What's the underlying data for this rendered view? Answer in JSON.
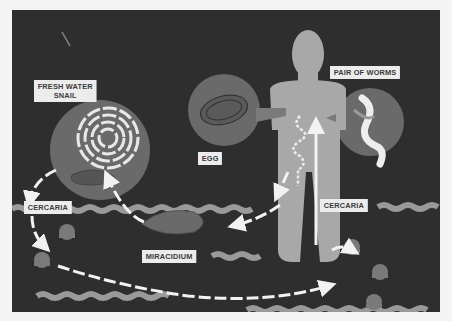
{
  "diagram": {
    "labels": {
      "snail": "FRESH WATER\nSNAIL",
      "egg": "EGG",
      "worms": "PAIR OF WORMS",
      "cercaria_left": "CERCARIA",
      "cercaria_right": "CERCARIA",
      "miracidium": "MIRACIDIUM"
    },
    "colors": {
      "background": "#2e2e2e",
      "circle": "#6a6a6a",
      "human": "#a8a8a8",
      "water": "#9a9a9a",
      "arrow": "#f2f2f2",
      "label_bg": "#ececec",
      "label_text": "#3a3a3a",
      "page": "#f4f4f4"
    }
  }
}
